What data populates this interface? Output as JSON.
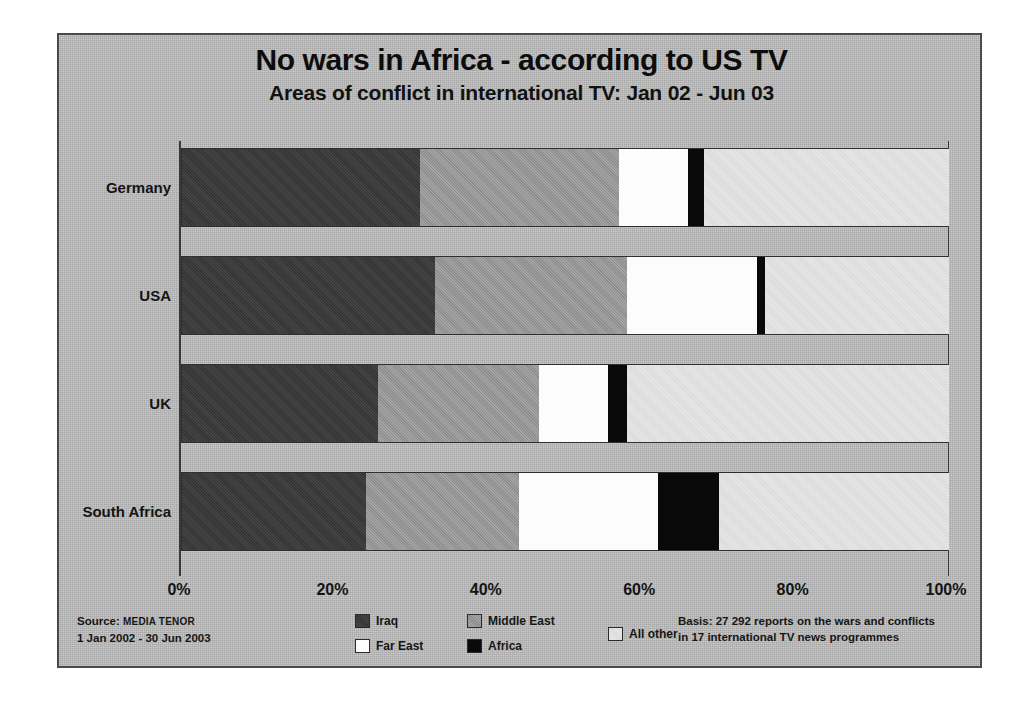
{
  "titles": {
    "main": "No wars in Africa - according to US TV",
    "sub": "Areas of conflict in international TV: Jan 02 - Jun 03"
  },
  "footer": {
    "source_line1_prefix": "Source: ",
    "source_line1_name": "MEDIA TENOR",
    "source_line2": "1 Jan 2002 - 30 Jun 2003",
    "basis_line1": "Basis: 27 292 reports on the wars and conflicts",
    "basis_line2": "in 17 international TV news programmes"
  },
  "legend": {
    "iraq": "Iraq",
    "middle_east": "Middle East",
    "far_east": "Far East",
    "africa": "Africa",
    "all_other": "All other"
  },
  "colors": {
    "iraq": "#3a3a3a",
    "middle_east": "#9a9a9a",
    "far_east": "#fcfcfc",
    "africa": "#090909",
    "all_other": "#e3e3e3",
    "background": "#b9b9b9",
    "frame": "#4a4a4a",
    "text": "#141414"
  },
  "chart_data": {
    "type": "bar",
    "orientation": "horizontal",
    "stacked": true,
    "normalized": "percent",
    "title": "No wars in Africa - according to US TV",
    "subtitle": "Areas of conflict in international TV: Jan 02 - Jun 03",
    "xlabel": "",
    "ylabel": "",
    "xlim": [
      0,
      100
    ],
    "xticks": [
      0,
      20,
      40,
      60,
      80,
      100
    ],
    "xticklabels": [
      "0%",
      "20%",
      "40%",
      "60%",
      "80%",
      "100%"
    ],
    "grid": false,
    "legend_position": "bottom",
    "categories": [
      "Germany",
      "USA",
      "UK",
      "South Africa"
    ],
    "series": [
      {
        "name": "Iraq",
        "values": [
          31,
          33,
          25.5,
          24
        ]
      },
      {
        "name": "Middle East",
        "values": [
          26,
          25,
          21,
          20
        ]
      },
      {
        "name": "Far East",
        "values": [
          9,
          17,
          9,
          18
        ]
      },
      {
        "name": "Africa",
        "values": [
          2,
          1,
          2.5,
          8
        ]
      },
      {
        "name": "All other",
        "values": [
          32,
          24,
          42,
          30
        ]
      }
    ],
    "annotations": [
      "Basis: 27 292 reports on the wars and conflicts in 17 international TV news programmes",
      "Source: MEDIA TENOR, 1 Jan 2002 - 30 Jun 2003"
    ]
  }
}
